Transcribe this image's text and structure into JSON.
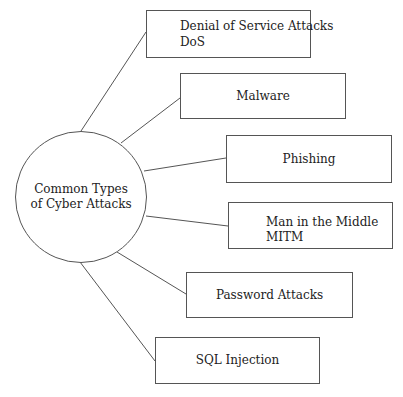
{
  "diagram": {
    "type": "mind-map",
    "hub": {
      "label_line1": "Common Types",
      "label_line2": "of Cyber Attacks"
    },
    "nodes": [
      {
        "id": "dos",
        "line1": "Denial of Service Attacks",
        "line2": "DoS"
      },
      {
        "id": "malware",
        "line1": "Malware"
      },
      {
        "id": "phishing",
        "line1": "Phishing"
      },
      {
        "id": "mitm",
        "line1": "Man in the Middle",
        "line2": "MITM"
      },
      {
        "id": "password",
        "line1": "Password Attacks"
      },
      {
        "id": "sql",
        "line1": "SQL Injection"
      }
    ],
    "colors": {
      "stroke": "#555555",
      "text": "#222222",
      "background": "#ffffff"
    }
  }
}
